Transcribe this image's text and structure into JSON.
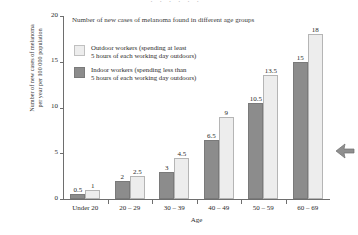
{
  "page": {
    "background": "#ffffff",
    "cut_text": "· · · · · ·"
  },
  "colors": {
    "indoor_fill": "#8c8c8c",
    "outdoor_fill": "#ededed",
    "axis": "#6e6e6e",
    "text": "#2b2b2b"
  },
  "annotations": {
    "arrow_marker": "left-pointing-arrow"
  },
  "chart_data": {
    "type": "bar",
    "title": "Number of new cases of melanoma found in different age groups",
    "xlabel": "Age",
    "ylabel": "Number of new cases of melanoma\nper year per 100 000 population",
    "categories": [
      "Under 20",
      "20 – 29",
      "30 – 39",
      "40 – 49",
      "50 – 59",
      "60 – 69"
    ],
    "series": [
      {
        "name": "Indoor workers (spending less than\n5 hours of each working day outdoors)",
        "short_name": "Indoor workers",
        "color": "#8c8c8c",
        "values": [
          0.5,
          2,
          3,
          6.5,
          10.5,
          15
        ],
        "labels": [
          "0.5",
          "2",
          "3",
          "6.5",
          "10.5",
          "15"
        ]
      },
      {
        "name": "Outdoor workers (spending at least\n5 hours of each working day outdoors)",
        "short_name": "Outdoor workers",
        "color": "#ededed",
        "values": [
          1,
          2.5,
          4.5,
          9,
          13.5,
          18
        ],
        "labels": [
          "1",
          "2.5",
          "4.5",
          "9",
          "13.5",
          "18"
        ]
      }
    ],
    "ylim": [
      0,
      20
    ],
    "yticks": [
      0,
      5,
      10,
      15,
      20
    ],
    "ytick_labels": [
      "0",
      "5",
      "10",
      "15",
      "20"
    ],
    "grid": false,
    "legend_position": "upper-left-inside",
    "legend_order": [
      "Outdoor workers (spending at least\n5 hours of each working day outdoors)",
      "Indoor workers (spending less than\n5 hours of each working day outdoors)"
    ]
  }
}
